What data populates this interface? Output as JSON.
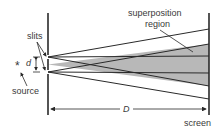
{
  "diagram": {
    "labels": {
      "slits": "slits",
      "source": "source",
      "superposition_line1": "superposition",
      "superposition_line2": "region",
      "screen": "screen",
      "d": "d",
      "D": "D",
      "source_symbol": "*"
    },
    "colors": {
      "line": "#2a2a2a",
      "shade": "#b8b8b8",
      "text": "#3a3a3a",
      "background": "#ffffff"
    }
  }
}
